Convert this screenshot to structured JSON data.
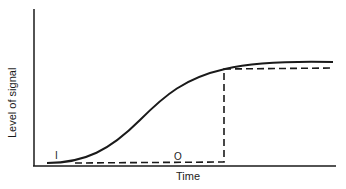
{
  "diagram": {
    "y_axis_label": "Level of signal",
    "x_axis_label": "Time",
    "curve_labels": {
      "input": "I",
      "output": "O"
    },
    "curves": [
      {
        "name": "I",
        "style": "solid",
        "description": "sigmoid rise from baseline to plateau"
      },
      {
        "name": "O",
        "style": "dashed",
        "description": "flat at baseline, then step up to plateau slightly below I"
      }
    ],
    "colors": {
      "line": "#1a1a1a",
      "background": "#ffffff"
    }
  }
}
